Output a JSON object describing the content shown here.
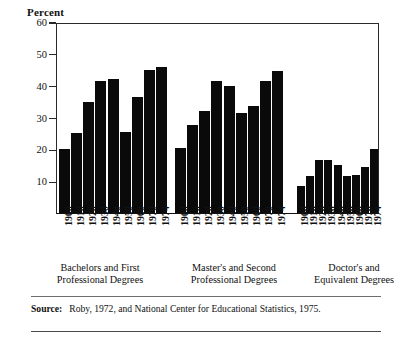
{
  "figure": {
    "y_axis_title": "Percent",
    "source_label": "Source:",
    "source_text": "Roby, 1972, and National Center for Educational Statistics, 1975."
  },
  "chart_data": {
    "type": "bar",
    "title": "",
    "xlabel": "",
    "ylabel": "Percent",
    "ylim": [
      0,
      60
    ],
    "yticks": [
      10,
      20,
      30,
      40,
      50,
      60
    ],
    "grid": false,
    "legend": "none",
    "categories": [
      "1900",
      "1910",
      "1920",
      "1930",
      "1940",
      "1950",
      "1960",
      "1970",
      "1974"
    ],
    "groups": [
      {
        "name": "Bachelors and First Professional Degrees",
        "caption_line1": "Bachelors and First",
        "caption_line2": "Professional Degrees",
        "values": [
          20,
          25,
          35,
          41.5,
          42,
          25.5,
          36.5,
          45,
          46
        ]
      },
      {
        "name": "Master's and Second Professional Degrees",
        "caption_line1": "Master's and Second",
        "caption_line2": "Professional Degrees",
        "values": [
          20.5,
          27.5,
          32,
          41.5,
          40,
          31.5,
          33.5,
          41.5,
          44.5
        ]
      },
      {
        "name": "Doctor's and Equivalent Degrees",
        "caption_line1": "Doctor's and",
        "caption_line2": "Equivalent Degrees",
        "values": [
          8.5,
          11.5,
          16.5,
          16.5,
          15,
          11.5,
          12,
          14.5,
          20
        ]
      }
    ],
    "bar_color": "#0a0a0a"
  }
}
